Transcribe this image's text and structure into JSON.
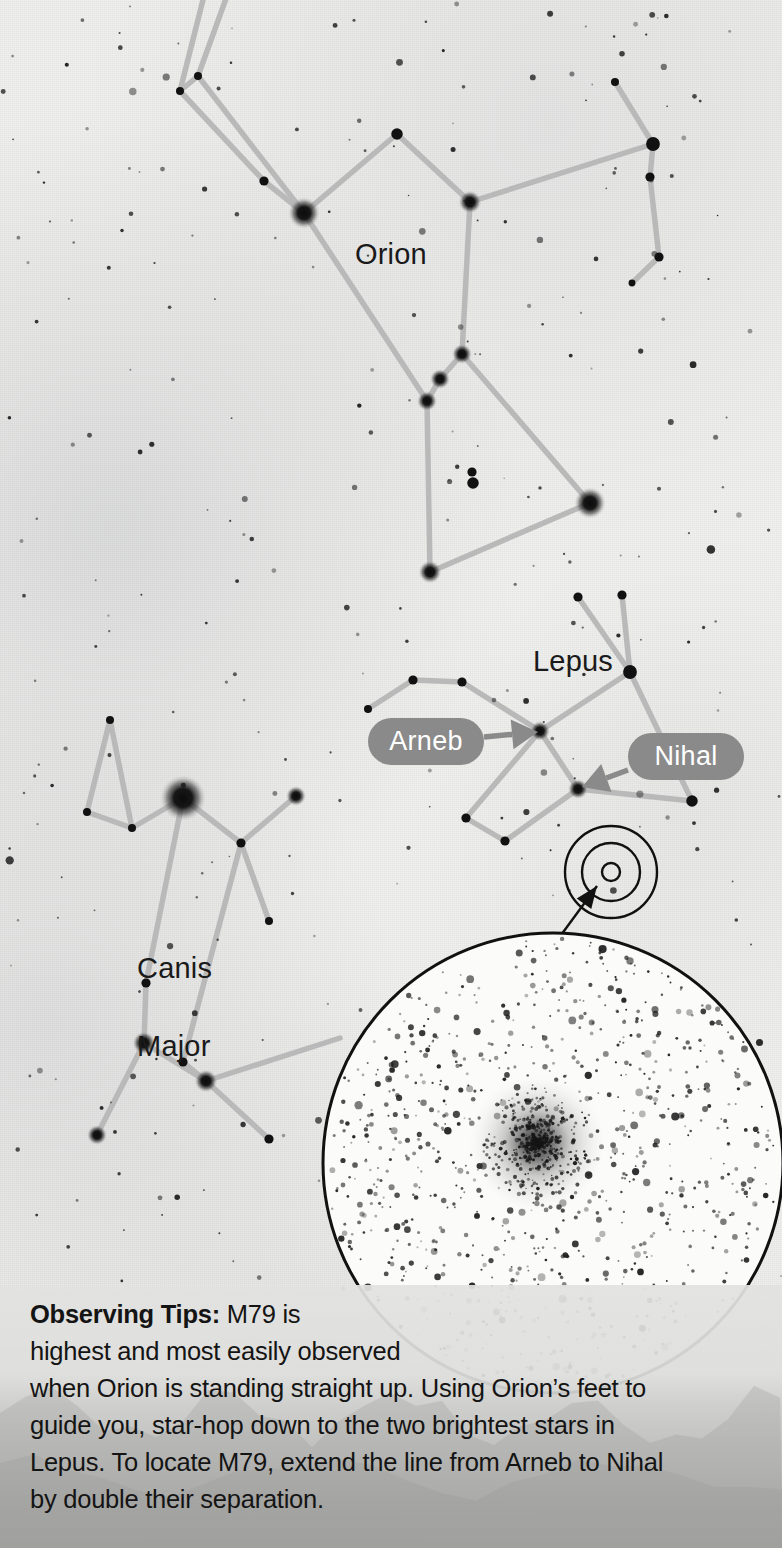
{
  "page": {
    "kind": "star-chart-finder-chart",
    "target_object": "M79",
    "width": 782,
    "height": 1548
  },
  "colors": {
    "sky_background": "#f1f1ef",
    "star": "#111111",
    "constellation_line": "#b9b9b9",
    "pill_fill": "#8a8a8a",
    "pill_text": "#ffffff",
    "label_text": "#1a1a1a",
    "caption_band": "#d8d8d6",
    "caption_text": "#141414",
    "inset_outline": "#111111"
  },
  "constellations": [
    {
      "name": "Orion",
      "label": "Orion",
      "label_x": 355,
      "label_y": 238,
      "font_size": 29
    },
    {
      "name": "Lepus",
      "label": "Lepus",
      "label_x": 533,
      "label_y": 645,
      "font_size": 29
    },
    {
      "name": "Canis Major",
      "label_line1": "Canis",
      "label_line2": "Major",
      "label_x": 104,
      "label_y": 910,
      "font_size": 29
    }
  ],
  "star_labels": [
    {
      "name": "Arneb",
      "text": "Arneb",
      "pill": {
        "x": 368,
        "y": 718,
        "w": 116,
        "h": 47,
        "font_size": 27
      },
      "arrow": {
        "from_x": 484,
        "from_y": 737,
        "to_x": 538,
        "to_y": 732
      },
      "points_to_star": "arneb-star"
    },
    {
      "name": "Nihal",
      "text": "Nihal",
      "pill": {
        "x": 628,
        "y": 733,
        "w": 116,
        "h": 47,
        "font_size": 27
      },
      "arrow": {
        "from_x": 628,
        "from_y": 770,
        "to_x": 582,
        "to_y": 787
      },
      "points_to_star": "nihal-star"
    }
  ],
  "inset": {
    "locator": {
      "center_x": 611,
      "center_y": 872,
      "outer_radius": 46,
      "mid_radius": 29,
      "inner_radius": 9,
      "label": "M79 locator rings"
    },
    "pointer_line": {
      "x1": 597,
      "y1": 886,
      "x2": 553,
      "y2": 946
    },
    "eyepiece_circle": {
      "center_x": 553,
      "center_y": 1163,
      "radius": 230,
      "label": "M79 eyepiece field view"
    },
    "cluster": {
      "center_x": 537,
      "center_y": 1143,
      "radius": 36,
      "label": "M79 globular cluster"
    }
  },
  "caption": {
    "heading": "Observing Tips:",
    "lines": [
      "M79 is",
      "highest and most easily observed",
      "when Orion is standing straight up. Using Orion’s feet to",
      "guide you, star-hop down to the two brightest stars in",
      "Lepus. To locate M79, extend the line from Arneb to Nihal",
      "by double their separation."
    ],
    "full_text": "Observing Tips: M79 is highest and most easily observed when Orion is standing straight up. Using Orion’s feet to guide you, star-hop down to the two brightest stars in Lepus. To locate M79, extend the line from Arneb to Nihal by double their separation."
  },
  "chart_data": {
    "type": "scatter",
    "xlabel": "",
    "ylabel": "",
    "stars": [
      {
        "id": "orion-club-a",
        "x": 198,
        "y": 76,
        "r": 3.5,
        "constellation": "Orion"
      },
      {
        "id": "orion-club-b",
        "x": 180,
        "y": 91,
        "r": 3.5,
        "constellation": "Orion"
      },
      {
        "id": "orion-club-top1",
        "x": 232,
        "y": -18,
        "r": 3,
        "constellation": "Orion"
      },
      {
        "id": "orion-club-top2",
        "x": 208,
        "y": -20,
        "r": 3,
        "constellation": "Orion"
      },
      {
        "id": "orion-shoulderL",
        "x": 264,
        "y": 181,
        "r": 4,
        "constellation": "Orion"
      },
      {
        "id": "betelgeuse",
        "x": 304,
        "y": 213,
        "r": 11,
        "constellation": "Orion",
        "name": "Betelgeuse"
      },
      {
        "id": "orion-head",
        "x": 397,
        "y": 134,
        "r": 5,
        "constellation": "Orion"
      },
      {
        "id": "bellatrix",
        "x": 470,
        "y": 202,
        "r": 8,
        "constellation": "Orion",
        "name": "Bellatrix"
      },
      {
        "id": "orion-shield1",
        "x": 653,
        "y": 144,
        "r": 6,
        "constellation": "Orion"
      },
      {
        "id": "orion-shield2",
        "x": 650,
        "y": 177,
        "r": 4,
        "constellation": "Orion"
      },
      {
        "id": "orion-shield3",
        "x": 659,
        "y": 257,
        "r": 4,
        "constellation": "Orion"
      },
      {
        "id": "orion-shield4",
        "x": 632,
        "y": 283,
        "r": 3,
        "constellation": "Orion"
      },
      {
        "id": "orion-shield-top",
        "x": 615,
        "y": 82,
        "r": 3.5,
        "constellation": "Orion"
      },
      {
        "id": "alnitak",
        "x": 462,
        "y": 354,
        "r": 7,
        "constellation": "Orion",
        "name": "Alnitak"
      },
      {
        "id": "alnilam",
        "x": 440,
        "y": 379,
        "r": 7,
        "constellation": "Orion",
        "name": "Alnilam"
      },
      {
        "id": "mintaka",
        "x": 427,
        "y": 401,
        "r": 7,
        "constellation": "Orion",
        "name": "Mintaka"
      },
      {
        "id": "saiph",
        "x": 430,
        "y": 572,
        "r": 8,
        "constellation": "Orion",
        "name": "Saiph"
      },
      {
        "id": "rigel",
        "x": 590,
        "y": 503,
        "r": 11,
        "constellation": "Orion",
        "name": "Rigel"
      },
      {
        "id": "orion-sword1",
        "x": 472,
        "y": 472,
        "r": 4,
        "constellation": "Orion"
      },
      {
        "id": "orion-sword2",
        "x": 473,
        "y": 483,
        "r": 5,
        "constellation": "Orion"
      },
      {
        "id": "lepus-ear1",
        "x": 578,
        "y": 597,
        "r": 4,
        "constellation": "Lepus"
      },
      {
        "id": "lepus-ear2",
        "x": 622,
        "y": 595,
        "r": 4,
        "constellation": "Lepus"
      },
      {
        "id": "lepus-head",
        "x": 630,
        "y": 672,
        "r": 6,
        "constellation": "Lepus"
      },
      {
        "id": "arneb-star",
        "x": 540,
        "y": 731,
        "r": 7,
        "constellation": "Lepus",
        "name": "Arneb"
      },
      {
        "id": "nihal-star",
        "x": 578,
        "y": 789,
        "r": 7,
        "constellation": "Lepus",
        "name": "Nihal"
      },
      {
        "id": "lepus-back1",
        "x": 413,
        "y": 680,
        "r": 4,
        "constellation": "Lepus"
      },
      {
        "id": "lepus-back2",
        "x": 462,
        "y": 682,
        "r": 4,
        "constellation": "Lepus"
      },
      {
        "id": "lepus-back3",
        "x": 368,
        "y": 709,
        "r": 3.5,
        "constellation": "Lepus"
      },
      {
        "id": "lepus-foot1",
        "x": 466,
        "y": 818,
        "r": 4,
        "constellation": "Lepus"
      },
      {
        "id": "lepus-foot2",
        "x": 505,
        "y": 841,
        "r": 4,
        "constellation": "Lepus"
      },
      {
        "id": "lepus-tail",
        "x": 692,
        "y": 801,
        "r": 5,
        "constellation": "Lepus"
      },
      {
        "id": "sirius",
        "x": 183,
        "y": 798,
        "r": 16,
        "constellation": "Canis Major",
        "name": "Sirius"
      },
      {
        "id": "cma-ear-top",
        "x": 110,
        "y": 720,
        "r": 3.5,
        "constellation": "Canis Major"
      },
      {
        "id": "cma-ear-left",
        "x": 87,
        "y": 812,
        "r": 3.5,
        "constellation": "Canis Major"
      },
      {
        "id": "cma-ear-right",
        "x": 132,
        "y": 828,
        "r": 3.5,
        "constellation": "Canis Major"
      },
      {
        "id": "cma-neck",
        "x": 241,
        "y": 843,
        "r": 4,
        "constellation": "Canis Major"
      },
      {
        "id": "mirzam",
        "x": 296,
        "y": 796,
        "r": 7,
        "constellation": "Canis Major",
        "name": "Mirzam"
      },
      {
        "id": "cma-leg1",
        "x": 269,
        "y": 921,
        "r": 3.5,
        "constellation": "Canis Major"
      },
      {
        "id": "cma-mid",
        "x": 146,
        "y": 983,
        "r": 4,
        "constellation": "Canis Major"
      },
      {
        "id": "wezen",
        "x": 144,
        "y": 1043,
        "r": 8,
        "constellation": "Canis Major",
        "name": "Wezen"
      },
      {
        "id": "adhara",
        "x": 206,
        "y": 1081,
        "r": 8,
        "constellation": "Canis Major",
        "name": "Adhara"
      },
      {
        "id": "cma-knee",
        "x": 183,
        "y": 1062,
        "r": 4,
        "constellation": "Canis Major"
      },
      {
        "id": "aludra",
        "x": 97,
        "y": 1135,
        "r": 7,
        "constellation": "Canis Major",
        "name": "Aludra"
      },
      {
        "id": "cma-tail",
        "x": 269,
        "y": 1139,
        "r": 4,
        "constellation": "Canis Major"
      }
    ],
    "lines": [
      {
        "constellation": "Orion",
        "path": [
          [
            232,
            -18
          ],
          [
            198,
            76
          ],
          [
            180,
            91
          ],
          [
            264,
            181
          ],
          [
            304,
            213
          ]
        ]
      },
      {
        "constellation": "Orion",
        "path": [
          [
            208,
            -20
          ],
          [
            180,
            91
          ]
        ]
      },
      {
        "constellation": "Orion",
        "path": [
          [
            198,
            76
          ],
          [
            304,
            213
          ]
        ]
      },
      {
        "constellation": "Orion",
        "path": [
          [
            304,
            213
          ],
          [
            397,
            134
          ],
          [
            470,
            202
          ]
        ]
      },
      {
        "constellation": "Orion",
        "path": [
          [
            470,
            202
          ],
          [
            653,
            144
          ],
          [
            615,
            82
          ]
        ]
      },
      {
        "constellation": "Orion",
        "path": [
          [
            653,
            144
          ],
          [
            650,
            177
          ],
          [
            659,
            257
          ],
          [
            632,
            283
          ]
        ]
      },
      {
        "constellation": "Orion",
        "path": [
          [
            470,
            202
          ],
          [
            462,
            354
          ]
        ]
      },
      {
        "constellation": "Orion",
        "path": [
          [
            304,
            213
          ],
          [
            427,
            401
          ]
        ]
      },
      {
        "constellation": "Orion",
        "path": [
          [
            462,
            354
          ],
          [
            440,
            379
          ],
          [
            427,
            401
          ]
        ]
      },
      {
        "constellation": "Orion",
        "path": [
          [
            427,
            401
          ],
          [
            430,
            572
          ],
          [
            590,
            503
          ],
          [
            462,
            354
          ]
        ]
      },
      {
        "constellation": "Lepus",
        "path": [
          [
            578,
            597
          ],
          [
            630,
            672
          ],
          [
            622,
            595
          ]
        ]
      },
      {
        "constellation": "Lepus",
        "path": [
          [
            630,
            672
          ],
          [
            540,
            731
          ]
        ]
      },
      {
        "constellation": "Lepus",
        "path": [
          [
            630,
            672
          ],
          [
            692,
            801
          ],
          [
            578,
            789
          ]
        ]
      },
      {
        "constellation": "Lepus",
        "path": [
          [
            368,
            709
          ],
          [
            413,
            680
          ],
          [
            462,
            682
          ],
          [
            540,
            731
          ]
        ]
      },
      {
        "constellation": "Lepus",
        "path": [
          [
            540,
            731
          ],
          [
            578,
            789
          ]
        ]
      },
      {
        "constellation": "Lepus",
        "path": [
          [
            540,
            731
          ],
          [
            466,
            818
          ],
          [
            505,
            841
          ],
          [
            578,
            789
          ]
        ]
      },
      {
        "constellation": "Canis Major",
        "path": [
          [
            110,
            720
          ],
          [
            87,
            812
          ],
          [
            132,
            828
          ],
          [
            183,
            798
          ]
        ]
      },
      {
        "constellation": "Canis Major",
        "path": [
          [
            110,
            720
          ],
          [
            132,
            828
          ]
        ]
      },
      {
        "constellation": "Canis Major",
        "path": [
          [
            183,
            798
          ],
          [
            241,
            843
          ],
          [
            296,
            796
          ]
        ]
      },
      {
        "constellation": "Canis Major",
        "path": [
          [
            241,
            843
          ],
          [
            269,
            921
          ]
        ]
      },
      {
        "constellation": "Canis Major",
        "path": [
          [
            183,
            798
          ],
          [
            146,
            983
          ],
          [
            144,
            1043
          ]
        ]
      },
      {
        "constellation": "Canis Major",
        "path": [
          [
            241,
            843
          ],
          [
            183,
            1062
          ],
          [
            206,
            1081
          ]
        ]
      },
      {
        "constellation": "Canis Major",
        "path": [
          [
            144,
            1043
          ],
          [
            97,
            1135
          ]
        ]
      },
      {
        "constellation": "Canis Major",
        "path": [
          [
            144,
            1043
          ],
          [
            206,
            1081
          ],
          [
            269,
            1139
          ]
        ]
      },
      {
        "constellation": "Canis Major",
        "path": [
          [
            206,
            1081
          ],
          [
            340,
            1038
          ]
        ]
      }
    ]
  }
}
